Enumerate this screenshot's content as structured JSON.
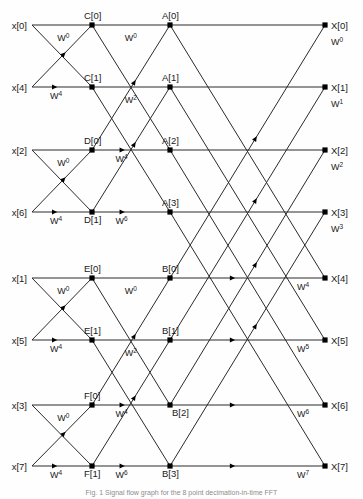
{
  "figure": {
    "caption": "Fig. 1 Signal flow graph for the 8 point decimation-in-time FFT",
    "stages": 3,
    "points": 8,
    "line_color": "#2b2b2b",
    "node_color": "#000000",
    "background": "#fefefe"
  },
  "geometry": {
    "col_x": [
      32,
      92,
      170,
      325
    ],
    "row_y": [
      25,
      87,
      150,
      212,
      278,
      340,
      405,
      466
    ],
    "node_r": 2.6
  },
  "inputs": [
    {
      "label": "x[0]",
      "row": 0
    },
    {
      "label": "x[4]",
      "row": 1
    },
    {
      "label": "x[2]",
      "row": 2
    },
    {
      "label": "x[6]",
      "row": 3
    },
    {
      "label": "x[1]",
      "row": 4
    },
    {
      "label": "x[5]",
      "row": 5
    },
    {
      "label": "x[3]",
      "row": 6
    },
    {
      "label": "x[7]",
      "row": 7
    }
  ],
  "outputs": [
    {
      "label": "X[0]",
      "row": 0
    },
    {
      "label": "X[1]",
      "row": 1
    },
    {
      "label": "X[2]",
      "row": 2
    },
    {
      "label": "X[3]",
      "row": 3
    },
    {
      "label": "X[4]",
      "row": 4
    },
    {
      "label": "X[5]",
      "row": 5
    },
    {
      "label": "X[6]",
      "row": 6
    },
    {
      "label": "X[7]",
      "row": 7
    }
  ],
  "stage1_nodes": [
    {
      "label": "C[0]",
      "row": 0,
      "pos": "above"
    },
    {
      "label": "C[1]",
      "row": 1,
      "pos": "above"
    },
    {
      "label": "D[0]",
      "row": 2,
      "pos": "above"
    },
    {
      "label": "D[1]",
      "row": 3,
      "pos": "below"
    },
    {
      "label": "E[0]",
      "row": 4,
      "pos": "above"
    },
    {
      "label": "E[1]",
      "row": 5,
      "pos": "above"
    },
    {
      "label": "F[0]",
      "row": 6,
      "pos": "above"
    },
    {
      "label": "F[1]",
      "row": 7,
      "pos": "below"
    }
  ],
  "stage2_nodes": [
    {
      "label": "A[0]",
      "row": 0,
      "pos": "above"
    },
    {
      "label": "A[1]",
      "row": 1,
      "pos": "above"
    },
    {
      "label": "A[2]",
      "row": 2,
      "pos": "above"
    },
    {
      "label": "A[3]",
      "row": 3,
      "pos": "above"
    },
    {
      "label": "B[0]",
      "row": 4,
      "pos": "above"
    },
    {
      "label": "B[1]",
      "row": 5,
      "pos": "above"
    },
    {
      "label": "B[2]",
      "row": 6,
      "pos": "below-right"
    },
    {
      "label": "B[3]",
      "row": 7,
      "pos": "below"
    }
  ],
  "twiddles_stage1": [
    {
      "base": "W",
      "exp": "0",
      "row": 0,
      "where": "below-right-of-node"
    },
    {
      "base": "W",
      "exp": "4",
      "row": 1,
      "where": "on-line"
    },
    {
      "base": "W",
      "exp": "0",
      "row": 2,
      "where": "below-right-of-node"
    },
    {
      "base": "W",
      "exp": "4",
      "row": 3,
      "where": "on-line"
    },
    {
      "base": "W",
      "exp": "0",
      "row": 4,
      "where": "below-right-of-node"
    },
    {
      "base": "W",
      "exp": "4",
      "row": 5,
      "where": "on-line"
    },
    {
      "base": "W",
      "exp": "0",
      "row": 6,
      "where": "below-right-of-node"
    },
    {
      "base": "W",
      "exp": "4",
      "row": 7,
      "where": "on-line"
    }
  ],
  "twiddles_stage2": [
    {
      "base": "W",
      "exp": "0",
      "row": 0,
      "where": "below-right-of-node"
    },
    {
      "base": "W",
      "exp": "2",
      "row": 1,
      "where": "below-right-of-node"
    },
    {
      "base": "W",
      "exp": "4",
      "row": 2,
      "where": "on-line"
    },
    {
      "base": "W",
      "exp": "6",
      "row": 3,
      "where": "on-line"
    },
    {
      "base": "W",
      "exp": "0",
      "row": 4,
      "where": "below-right-of-node"
    },
    {
      "base": "W",
      "exp": "2",
      "row": 5,
      "where": "below-right-of-node"
    },
    {
      "base": "W",
      "exp": "4",
      "row": 6,
      "where": "on-line"
    },
    {
      "base": "W",
      "exp": "6",
      "row": 7,
      "where": "on-line"
    }
  ],
  "twiddles_stage3": [
    {
      "base": "W",
      "exp": "0",
      "row": 0,
      "where": "below-right-of-output"
    },
    {
      "base": "W",
      "exp": "1",
      "row": 1,
      "where": "below-right-of-output"
    },
    {
      "base": "W",
      "exp": "2",
      "row": 2,
      "where": "below-right-of-output"
    },
    {
      "base": "W",
      "exp": "3",
      "row": 3,
      "where": "below-right-of-output"
    },
    {
      "base": "W",
      "exp": "4",
      "row": 4,
      "where": "on-line"
    },
    {
      "base": "W",
      "exp": "5",
      "row": 5,
      "where": "on-line"
    },
    {
      "base": "W",
      "exp": "6",
      "row": 6,
      "where": "on-line"
    },
    {
      "base": "W",
      "exp": "7",
      "row": 7,
      "where": "on-line"
    }
  ],
  "edges_stage1": [
    {
      "from_row": 0,
      "to_row": 0,
      "kind": "straight"
    },
    {
      "from_row": 1,
      "to_row": 1,
      "kind": "straight"
    },
    {
      "from_row": 0,
      "to_row": 1,
      "kind": "cross"
    },
    {
      "from_row": 1,
      "to_row": 0,
      "kind": "cross"
    },
    {
      "from_row": 2,
      "to_row": 2,
      "kind": "straight"
    },
    {
      "from_row": 3,
      "to_row": 3,
      "kind": "straight"
    },
    {
      "from_row": 2,
      "to_row": 3,
      "kind": "cross"
    },
    {
      "from_row": 3,
      "to_row": 2,
      "kind": "cross"
    },
    {
      "from_row": 4,
      "to_row": 4,
      "kind": "straight"
    },
    {
      "from_row": 5,
      "to_row": 5,
      "kind": "straight"
    },
    {
      "from_row": 4,
      "to_row": 5,
      "kind": "cross"
    },
    {
      "from_row": 5,
      "to_row": 4,
      "kind": "cross"
    },
    {
      "from_row": 6,
      "to_row": 6,
      "kind": "straight"
    },
    {
      "from_row": 7,
      "to_row": 7,
      "kind": "straight"
    },
    {
      "from_row": 6,
      "to_row": 7,
      "kind": "cross"
    },
    {
      "from_row": 7,
      "to_row": 6,
      "kind": "cross"
    }
  ],
  "edges_stage2": [
    {
      "from_row": 0,
      "to_row": 0,
      "kind": "straight"
    },
    {
      "from_row": 1,
      "to_row": 1,
      "kind": "straight"
    },
    {
      "from_row": 2,
      "to_row": 2,
      "kind": "straight"
    },
    {
      "from_row": 3,
      "to_row": 3,
      "kind": "straight"
    },
    {
      "from_row": 0,
      "to_row": 2,
      "kind": "cross"
    },
    {
      "from_row": 2,
      "to_row": 0,
      "kind": "cross"
    },
    {
      "from_row": 1,
      "to_row": 3,
      "kind": "cross"
    },
    {
      "from_row": 3,
      "to_row": 1,
      "kind": "cross"
    },
    {
      "from_row": 4,
      "to_row": 4,
      "kind": "straight"
    },
    {
      "from_row": 5,
      "to_row": 5,
      "kind": "straight"
    },
    {
      "from_row": 6,
      "to_row": 6,
      "kind": "straight"
    },
    {
      "from_row": 7,
      "to_row": 7,
      "kind": "straight"
    },
    {
      "from_row": 4,
      "to_row": 6,
      "kind": "cross"
    },
    {
      "from_row": 6,
      "to_row": 4,
      "kind": "cross"
    },
    {
      "from_row": 5,
      "to_row": 7,
      "kind": "cross"
    },
    {
      "from_row": 7,
      "to_row": 5,
      "kind": "cross"
    }
  ],
  "edges_stage3": [
    {
      "from_row": 0,
      "to_row": 0,
      "kind": "straight"
    },
    {
      "from_row": 1,
      "to_row": 1,
      "kind": "straight"
    },
    {
      "from_row": 2,
      "to_row": 2,
      "kind": "straight"
    },
    {
      "from_row": 3,
      "to_row": 3,
      "kind": "straight"
    },
    {
      "from_row": 4,
      "to_row": 4,
      "kind": "straight"
    },
    {
      "from_row": 5,
      "to_row": 5,
      "kind": "straight"
    },
    {
      "from_row": 6,
      "to_row": 6,
      "kind": "straight"
    },
    {
      "from_row": 7,
      "to_row": 7,
      "kind": "straight"
    },
    {
      "from_row": 0,
      "to_row": 4,
      "kind": "cross"
    },
    {
      "from_row": 4,
      "to_row": 0,
      "kind": "cross"
    },
    {
      "from_row": 1,
      "to_row": 5,
      "kind": "cross"
    },
    {
      "from_row": 5,
      "to_row": 1,
      "kind": "cross"
    },
    {
      "from_row": 2,
      "to_row": 6,
      "kind": "cross"
    },
    {
      "from_row": 6,
      "to_row": 2,
      "kind": "cross"
    },
    {
      "from_row": 3,
      "to_row": 7,
      "kind": "cross"
    },
    {
      "from_row": 7,
      "to_row": 3,
      "kind": "cross"
    }
  ]
}
